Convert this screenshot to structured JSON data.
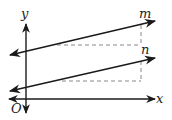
{
  "diagram": {
    "type": "coordinate-plane-with-parallel-lines",
    "labels": {
      "y_axis": "y",
      "x_axis": "x",
      "origin": "O",
      "line_m": "m",
      "line_n": "n"
    },
    "colors": {
      "line": "#1a1a1a",
      "dashed": "#888888",
      "background": "#ffffff"
    },
    "elements": {
      "y_axis": {
        "x": 26,
        "y1": 24,
        "y2": 113,
        "arrows": "both"
      },
      "x_axis": {
        "y": 99,
        "x1": 9,
        "x2": 155,
        "arrows": "both"
      },
      "line_m": {
        "x1": 10,
        "y1": 55,
        "x2": 155,
        "y2": 21,
        "arrows": "both"
      },
      "line_n": {
        "x1": 10,
        "y1": 91,
        "x2": 155,
        "y2": 58,
        "arrows": "both"
      },
      "slope_triangle_m": {
        "run_y": 45,
        "run_x1": 57,
        "run_x2": 141,
        "rise_x": 141,
        "rise_y1": 25,
        "rise_y2": 45,
        "style": "dashed"
      },
      "slope_triangle_n": {
        "run_y": 81,
        "run_x1": 62,
        "run_x2": 141,
        "rise_x": 141,
        "rise_y1": 61,
        "rise_y2": 81,
        "style": "dashed"
      }
    }
  }
}
